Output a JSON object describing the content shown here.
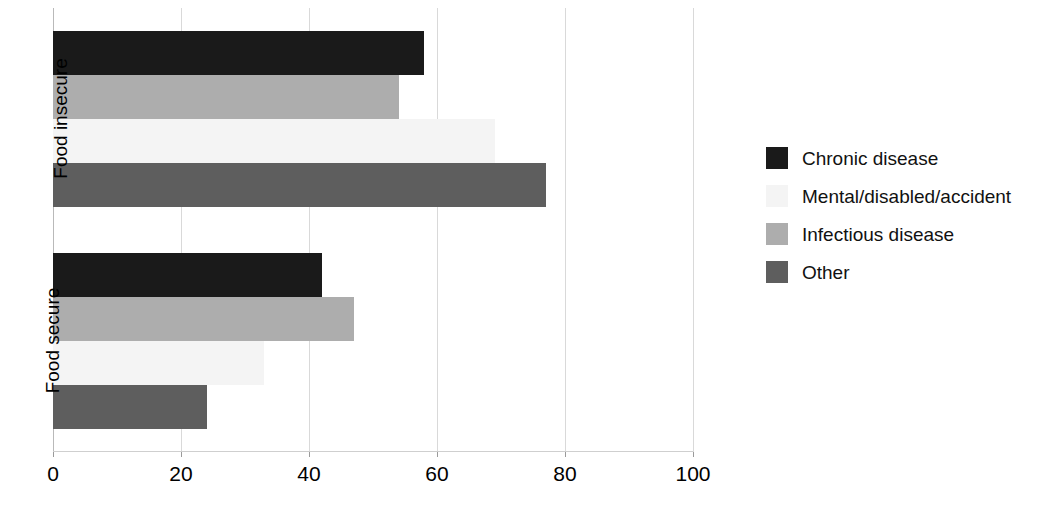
{
  "chart_data": {
    "type": "bar",
    "orientation": "horizontal",
    "grouped": true,
    "title": "",
    "xlabel": "",
    "ylabel": "",
    "categories": [
      "Food insecure",
      "Food secure"
    ],
    "series": [
      {
        "name": "Chronic disease",
        "color": "#1a1a1a",
        "values": [
          58,
          42
        ]
      },
      {
        "name": "Mental/disabled/accident",
        "color": "#f4f4f4",
        "values": [
          69,
          33
        ]
      },
      {
        "name": "Infectious disease",
        "color": "#adadad",
        "values": [
          54,
          47
        ]
      },
      {
        "name": "Other",
        "color": "#5e5e5e",
        "values": [
          77,
          24
        ]
      }
    ],
    "bar_order_top_to_bottom": [
      "Chronic disease",
      "Infectious disease",
      "Mental/disabled/accident",
      "Other"
    ],
    "xlim": [
      0,
      100
    ],
    "xticks": [
      "0",
      "20",
      "40",
      "60",
      "80",
      "100"
    ],
    "xtick_values": [
      0,
      20,
      40,
      60,
      80,
      100
    ],
    "grid": true,
    "legend_position": "right"
  },
  "legend": {
    "items": [
      {
        "label": "Chronic disease",
        "color": "#1a1a1a"
      },
      {
        "label": "Mental/disabled/accident",
        "color": "#f4f4f4"
      },
      {
        "label": "Infectious disease",
        "color": "#adadad"
      },
      {
        "label": "Other",
        "color": "#5e5e5e"
      }
    ]
  }
}
